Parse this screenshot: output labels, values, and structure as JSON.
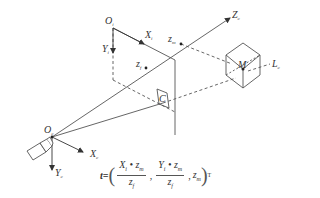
{
  "diagram": {
    "image_frame": {
      "origin": "O",
      "origin_sub": "i",
      "x_axis": "X",
      "x_sub": "i",
      "y_axis": "Y",
      "y_sub": "i"
    },
    "camera_frame": {
      "origin": "O",
      "origin_sub": "c",
      "x_axis": "X",
      "x_sub": "c",
      "y_axis": "Y",
      "y_sub": "c",
      "z_axis": "Z",
      "z_sub": "c"
    },
    "depth_labels": {
      "zm": "z",
      "zm_sub": "m",
      "zf": "z",
      "zf_sub": "f"
    },
    "points": {
      "C": "C",
      "M": "M",
      "L": "L",
      "L_sub": "c"
    },
    "formula": {
      "lhs": "t=",
      "term1_num": "X",
      "term1_num_sub": "i",
      "term1_num_op": " • z",
      "term1_num_sub2": "m",
      "term1_den": "z",
      "term1_den_sub": "f",
      "term2_num": "Y",
      "term2_num_sub": "i",
      "term2_num_op": " • z",
      "term2_num_sub2": "m",
      "term2_den": "z",
      "term2_den_sub": "f",
      "term3": "z",
      "term3_sub": "m",
      "open_paren": "(",
      "close_paren": ")",
      "comma": ",",
      "transpose": "T"
    },
    "colors": {
      "line": "#555555",
      "text": "#333333",
      "background": "#ffffff"
    }
  }
}
